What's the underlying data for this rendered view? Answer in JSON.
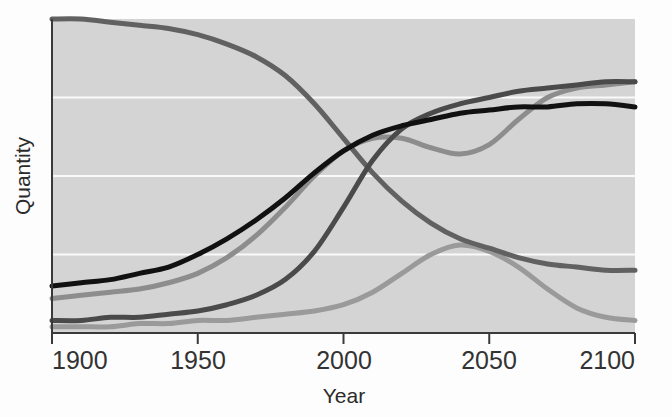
{
  "chart_data": {
    "type": "line",
    "title": "",
    "xlabel": "Year",
    "ylabel": "Quantity",
    "xlim": [
      1900,
      2100
    ],
    "ylim": [
      0,
      100
    ],
    "xticks": [
      1900,
      1950,
      2000,
      2050,
      2100
    ],
    "xticklabels": [
      "1900",
      "1950",
      "2000",
      "2050",
      "2100"
    ],
    "yticks": [],
    "yticklabels": [],
    "grid": true,
    "grid_orientation": "horizontal",
    "gridline_values": [
      25,
      50,
      75
    ],
    "legend": "none",
    "plot_background": "#d4d4d4",
    "gridline_color": "#fafafa",
    "figure_background": "#fdfdfd",
    "x": [
      1900,
      1910,
      1920,
      1930,
      1940,
      1950,
      1960,
      1970,
      1980,
      1990,
      2000,
      2010,
      2020,
      2030,
      2040,
      2050,
      2060,
      2070,
      2080,
      2090,
      2100
    ],
    "series": [
      {
        "name": "declining-resource",
        "color": "#616161",
        "linewidth": 5,
        "values": [
          100,
          100,
          99,
          98,
          97,
          95,
          92,
          88,
          82,
          73,
          62,
          51,
          42,
          35,
          30,
          27,
          24,
          22,
          21,
          20,
          20
        ]
      },
      {
        "name": "rising-adoption-dark",
        "color": "#4a4a4a",
        "linewidth": 5,
        "values": [
          4,
          4,
          5,
          5,
          6,
          7,
          9,
          12,
          17,
          26,
          40,
          55,
          65,
          70,
          73,
          75,
          77,
          78,
          79,
          80,
          80
        ]
      },
      {
        "name": "rising-adoption-black",
        "color": "#111111",
        "linewidth": 5,
        "values": [
          15,
          16,
          17,
          19,
          21,
          25,
          30,
          36,
          43,
          51,
          58,
          63,
          66,
          68,
          70,
          71,
          72,
          72,
          73,
          73,
          72
        ]
      },
      {
        "name": "plateau-dip-rise",
        "color": "#8d8d8d",
        "linewidth": 5,
        "values": [
          11,
          12,
          13,
          14,
          16,
          19,
          24,
          31,
          40,
          50,
          58,
          62,
          62,
          59,
          57,
          60,
          68,
          75,
          78,
          79,
          80
        ]
      },
      {
        "name": "transient-hump",
        "color": "#9a9a9a",
        "linewidth": 5,
        "values": [
          2,
          2,
          2,
          3,
          3,
          4,
          4,
          5,
          6,
          7,
          9,
          13,
          19,
          25,
          28,
          26,
          21,
          14,
          8,
          5,
          4
        ]
      }
    ]
  },
  "axes": {
    "x_title": "Year",
    "y_title": "Quantity",
    "x_tick_labels": [
      "1900",
      "1950",
      "2000",
      "2050",
      "2100"
    ]
  }
}
